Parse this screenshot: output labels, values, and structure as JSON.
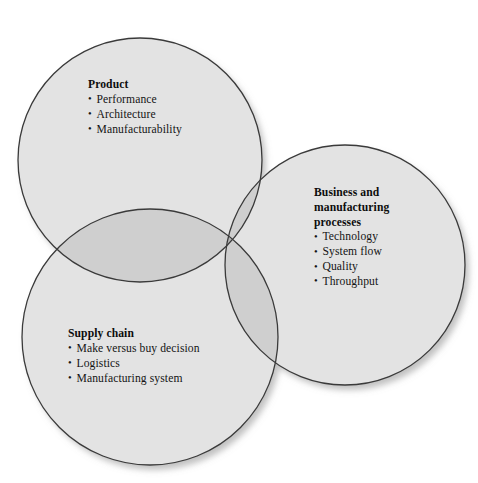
{
  "diagram": {
    "type": "venn",
    "set_count": 3,
    "circle_fill": "#e3e3e3",
    "circle_stroke": "#3a3a3a",
    "overlap_shade": "#cfcfcf",
    "triple_overlap_shade": "#b4b4b4",
    "background": "#ffffff",
    "text_color": "#111111",
    "sets": [
      {
        "id": "product",
        "title": "Product",
        "items": [
          "Performance",
          "Architecture",
          "Manufacturability"
        ],
        "cx": 140,
        "cy": 160,
        "r": 122
      },
      {
        "id": "business",
        "title": "Business and manufacturing processes",
        "title_lines": [
          "Business and",
          "manufacturing",
          "processes"
        ],
        "items": [
          "Technology",
          "System flow",
          "Quality",
          "Throughput"
        ],
        "cx": 345,
        "cy": 265,
        "r": 120
      },
      {
        "id": "supply",
        "title": "Supply chain",
        "items": [
          "Make versus buy decision",
          "Logistics",
          "Manufacturing system"
        ],
        "cx": 150,
        "cy": 337,
        "r": 128
      }
    ]
  }
}
